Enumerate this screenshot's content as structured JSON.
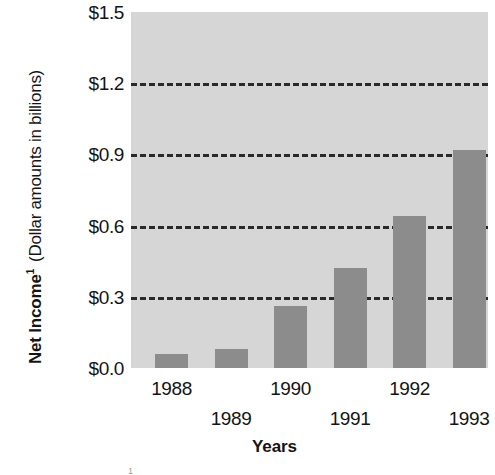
{
  "chart_data": {
    "type": "bar",
    "title": "",
    "subtitle": "",
    "xlabel": "Years",
    "ylabel": "Net Income¹ (Dollar amounts in billions)",
    "ylabel_main": "Net Income",
    "ylabel_superscript": "1",
    "ylabel_sub": "(Dollar amounts in billions)",
    "categories": [
      "1988",
      "1989",
      "1990",
      "1991",
      "1992",
      "1993"
    ],
    "values": [
      0.06,
      0.08,
      0.26,
      0.42,
      0.64,
      0.92
    ],
    "series": [
      {
        "name": "Net Income",
        "values": [
          0.06,
          0.08,
          0.26,
          0.42,
          0.64,
          0.92
        ]
      }
    ],
    "ylim": [
      0.0,
      1.5
    ],
    "yticks": [
      0.0,
      0.3,
      0.6,
      0.9,
      1.2,
      1.5
    ],
    "ytick_labels": [
      "$0.0",
      "$0.3",
      "$0.6",
      "$0.9",
      "$1.2",
      "$1.5"
    ],
    "gridlines_at": [
      0.3,
      0.6,
      0.9,
      1.2
    ],
    "grid": true,
    "legend": "none",
    "xtick_stagger": true,
    "xtick_rows": [
      [
        "1988",
        "1990",
        "1992"
      ],
      [
        "1989",
        "1991",
        "1993"
      ]
    ],
    "colors": {
      "bar": "#8c8c8c",
      "plot_background": "#d6d6d6",
      "gridline": "#2a2a2a",
      "text": "#141414",
      "page_background": "#ffffff"
    }
  },
  "axes": {
    "y": {
      "ticks": [
        {
          "label": "$1.5",
          "value": 1.5
        },
        {
          "label": "$1.2",
          "value": 1.2
        },
        {
          "label": "$0.9",
          "value": 0.9
        },
        {
          "label": "$0.6",
          "value": 0.6
        },
        {
          "label": "$0.3",
          "value": 0.3
        },
        {
          "label": "$0.0",
          "value": 0.0
        }
      ]
    },
    "x": {
      "title": "Years",
      "ticks": [
        {
          "label": "1988",
          "row": 0
        },
        {
          "label": "1989",
          "row": 1
        },
        {
          "label": "1990",
          "row": 0
        },
        {
          "label": "1991",
          "row": 1
        },
        {
          "label": "1992",
          "row": 0
        },
        {
          "label": "1993",
          "row": 1
        }
      ]
    }
  },
  "footnote": {
    "marker": "1"
  }
}
